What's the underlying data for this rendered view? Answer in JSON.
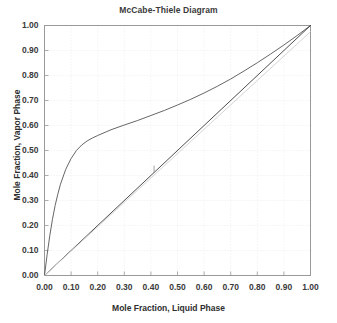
{
  "chart_data": {
    "type": "line",
    "title": "McCabe-Thiele Diagram",
    "xlabel": "Mole Fraction, Liquid Phase",
    "ylabel": "Mole Fraction, Vapor Phase",
    "xlim": [
      0.0,
      1.0
    ],
    "ylim": [
      0.0,
      1.0
    ],
    "grid": true,
    "legend": "none",
    "xticks": [
      "0.00",
      "0.10",
      "0.20",
      "0.30",
      "0.40",
      "0.50",
      "0.60",
      "0.70",
      "0.80",
      "0.90",
      "1.00"
    ],
    "yticks": [
      "0.00",
      "0.10",
      "0.20",
      "0.30",
      "0.40",
      "0.50",
      "0.60",
      "0.70",
      "0.80",
      "0.90",
      "1.00"
    ],
    "xtick_values": [
      0.0,
      0.1,
      0.2,
      0.3,
      0.4,
      0.5,
      0.6,
      0.7,
      0.8,
      0.9,
      1.0
    ],
    "ytick_values": [
      0.0,
      0.1,
      0.2,
      0.3,
      0.4,
      0.5,
      0.6,
      0.7,
      0.8,
      0.9,
      1.0
    ],
    "series": [
      {
        "name": "equilibrium-curve",
        "color": "#555555",
        "width": 0.9,
        "x": [
          0.0,
          0.01,
          0.02,
          0.03,
          0.04,
          0.05,
          0.06,
          0.08,
          0.1,
          0.12,
          0.14,
          0.16,
          0.18,
          0.2,
          0.25,
          0.3,
          0.35,
          0.4,
          0.45,
          0.5,
          0.55,
          0.6,
          0.65,
          0.7,
          0.75,
          0.8,
          0.85,
          0.9,
          0.95,
          1.0
        ],
        "y": [
          0.0,
          0.085,
          0.16,
          0.225,
          0.28,
          0.325,
          0.365,
          0.425,
          0.468,
          0.5,
          0.522,
          0.538,
          0.55,
          0.56,
          0.583,
          0.602,
          0.62,
          0.64,
          0.66,
          0.682,
          0.705,
          0.73,
          0.757,
          0.786,
          0.818,
          0.851,
          0.886,
          0.922,
          0.96,
          1.0
        ]
      },
      {
        "name": "operating-line-45-degree",
        "color": "#3a3a3a",
        "width": 0.9,
        "x": [
          0.0,
          1.0
        ],
        "y": [
          0.0,
          1.0
        ]
      },
      {
        "name": "light-gray-reference-line",
        "color": "#cfcfcf",
        "width": 0.9,
        "x": [
          0.0,
          1.0
        ],
        "y": [
          0.0,
          0.975
        ]
      },
      {
        "name": "feed-drop-line",
        "color": "#8a8a8a",
        "width": 0.8,
        "x": [
          0.412,
          0.412
        ],
        "y": [
          0.412,
          0.438
        ]
      }
    ],
    "colors": {
      "background": "#ffffff",
      "axis": "#999999",
      "grid": "#e6e6e6",
      "text": "#3a3a3a"
    }
  }
}
